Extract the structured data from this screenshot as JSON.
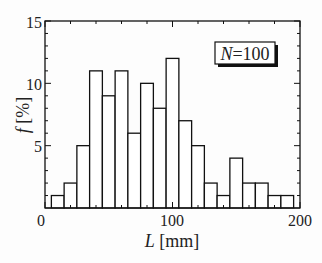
{
  "chart_data": {
    "type": "bar",
    "title": "",
    "xlabel_var": "L",
    "xlabel_unit": "[mm]",
    "ylabel_var": "f",
    "ylabel_unit": "[%]",
    "xlim": [
      0,
      200
    ],
    "ylim": [
      0,
      15
    ],
    "xticks": [
      0,
      100,
      200
    ],
    "yticks": [
      5,
      10,
      15
    ],
    "ytick_zero": "0",
    "bin_width": 10,
    "bin_centers": [
      10,
      20,
      30,
      40,
      50,
      60,
      70,
      80,
      90,
      100,
      110,
      120,
      130,
      140,
      150,
      160,
      170,
      180,
      190
    ],
    "values": [
      1,
      2,
      5,
      11,
      9,
      11,
      6,
      10,
      8,
      12,
      7,
      5,
      2,
      1,
      4,
      2,
      2,
      1,
      1
    ],
    "grid": false,
    "annotation": {
      "var": "N",
      "text": "=100"
    }
  },
  "labels": {
    "x0": "0",
    "x100": "100",
    "x200": "200",
    "y5": "5",
    "y10": "10",
    "y15": "15",
    "xvar": "L",
    "xunit": " [mm]",
    "yvar": "f",
    "yunit": " [%]",
    "nvar": "N",
    "nval": "=100"
  }
}
